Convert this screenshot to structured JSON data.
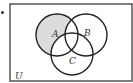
{
  "diagram": {
    "type": "venn",
    "universe_label": "U",
    "sets": [
      {
        "name": "A",
        "label": "A",
        "cx": 57,
        "cy": 35,
        "r": 21
      },
      {
        "name": "B",
        "label": "B",
        "cx": 86,
        "cy": 35,
        "r": 21
      },
      {
        "name": "C",
        "label": "C",
        "cx": 72,
        "cy": 54,
        "r": 21
      }
    ],
    "shaded_region": "A only (A − (B ∪ C))",
    "colors": {
      "shade": "#dcdcdc",
      "stroke": "#222222",
      "border": "#555555"
    }
  }
}
